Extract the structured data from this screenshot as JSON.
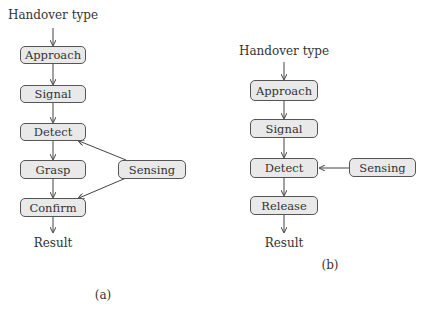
{
  "panel_a": {
    "input_label": "Handover type",
    "steps": [
      "Approach",
      "Signal",
      "Detect",
      "Grasp",
      "Confirm"
    ],
    "side_node": "Sensing",
    "output_label": "Result",
    "caption": "(a)"
  },
  "panel_b": {
    "input_label": "Handover type",
    "steps": [
      "Approach",
      "Signal",
      "Detect",
      "Release"
    ],
    "side_node": "Sensing",
    "output_label": "Result",
    "caption": "(b)"
  },
  "colors": {
    "box_fill": "#e9e9e9",
    "stroke": "#555555",
    "text": "#333333"
  }
}
